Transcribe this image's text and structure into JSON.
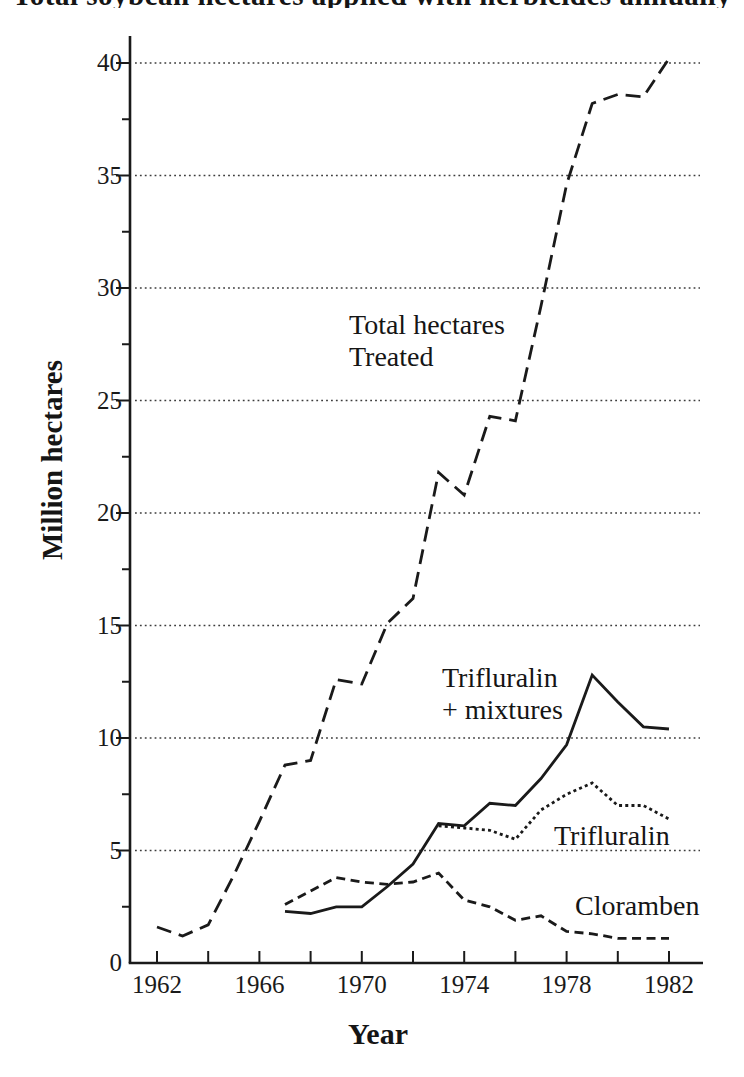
{
  "page": {
    "background": "#ffffff",
    "ink_color": "#1a1a1a"
  },
  "cropped_title": {
    "text": "Total soybean hectares applied with herbicides annually",
    "note_visible_state": "clipped at top edge of image"
  },
  "chart_data": {
    "type": "line",
    "xlabel": "Year",
    "ylabel": "Million hectares",
    "xlim": [
      1962,
      1982
    ],
    "ylim": [
      0,
      40
    ],
    "x_ticks": [
      1962,
      1966,
      1970,
      1974,
      1978,
      1982
    ],
    "x_tick_interval_years": 2,
    "y_ticks": [
      0,
      5,
      10,
      15,
      20,
      25,
      30,
      35,
      40
    ],
    "y_minor_tick_interval": 2.5,
    "grid": "horizontal-dotted-at-major-y-ticks",
    "legend_position": "inline-annotations",
    "series": [
      {
        "name": "Total hectares Treated",
        "line_style": "long-dash",
        "start_year": 1962,
        "values": [
          1.6,
          1.2,
          1.7,
          3.9,
          6.3,
          8.8,
          9.0,
          12.6,
          12.4,
          15.1,
          16.2,
          21.8,
          20.8,
          24.3,
          24.1,
          29.2,
          34.6,
          38.2,
          38.6,
          38.5,
          40.2
        ]
      },
      {
        "name": "Trifluralin + mixtures",
        "line_style": "solid",
        "start_year": 1967,
        "values": [
          2.3,
          2.2,
          2.5,
          2.5,
          3.4,
          4.4,
          6.2,
          6.1,
          7.1,
          7.0,
          8.2,
          9.7,
          12.8,
          11.6,
          10.5,
          10.4
        ]
      },
      {
        "name": "Trifluralin",
        "line_style": "dotted",
        "start_year": 1973,
        "values": [
          6.1,
          6.0,
          5.9,
          5.5,
          6.8,
          7.5,
          8.0,
          7.0,
          7.0,
          6.4
        ]
      },
      {
        "name": "Cloramben",
        "line_style": "medium-dash",
        "start_year": 1967,
        "values": [
          2.6,
          3.2,
          3.8,
          3.6,
          3.5,
          3.6,
          4.0,
          2.8,
          2.5,
          1.9,
          2.1,
          1.4,
          1.3,
          1.1,
          1.1,
          1.1
        ]
      }
    ],
    "annotations": [
      {
        "lines": [
          "Total hectares",
          "Treated"
        ]
      },
      {
        "lines": [
          "Trifluralin",
          "+ mixtures"
        ]
      },
      {
        "lines": [
          "Trifluralin"
        ]
      },
      {
        "lines": [
          "Cloramben"
        ]
      }
    ]
  }
}
